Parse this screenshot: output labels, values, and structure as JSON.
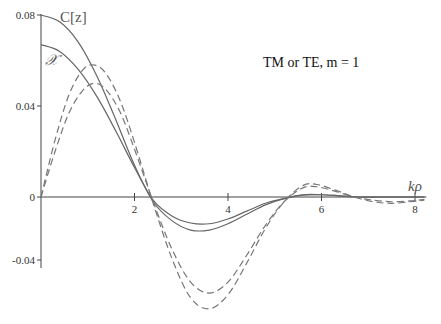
{
  "chart_data": {
    "type": "line",
    "title": "",
    "annotation": "TM or TE, m = 1",
    "xlabel": "kρ",
    "ylabel": "",
    "xlim": [
      0,
      8.2
    ],
    "ylim": [
      -0.04,
      0.08
    ],
    "grid": false,
    "x_ticks": [
      2,
      4,
      6,
      8
    ],
    "x_tick_labels": [
      "2",
      "4",
      "6",
      "8"
    ],
    "y_ticks": [
      0.08,
      0.04,
      0,
      -0.04
    ],
    "y_tick_labels": [
      "0.08",
      "0.04",
      "0",
      "-0.04"
    ],
    "series": [
      {
        "name": "C[z]",
        "style": "solid",
        "label": "C[z]",
        "x": [
          0,
          0.4,
          0.8,
          1.2,
          1.6,
          2.0,
          2.4,
          2.8,
          3.2,
          3.6,
          4.0,
          4.4,
          4.8,
          5.2,
          5.6,
          6.0,
          6.4,
          6.8,
          7.2,
          7.6,
          8.0,
          8.2
        ],
        "y": [
          0.08,
          0.077,
          0.068,
          0.053,
          0.034,
          0.014,
          -0.003,
          -0.015,
          -0.021,
          -0.021,
          -0.017,
          -0.011,
          -0.005,
          -0.001,
          0.001,
          0.001,
          0.0005,
          0.0,
          0.0,
          0.0,
          0.0,
          0.0
        ]
      },
      {
        "name": "X",
        "style": "solid",
        "label": "𝒳",
        "x": [
          0,
          0.4,
          0.8,
          1.2,
          1.6,
          2.0,
          2.4,
          2.8,
          3.2,
          3.6,
          4.0,
          4.4,
          4.8,
          5.2,
          5.6,
          6.0,
          6.4,
          6.8,
          7.2,
          7.6,
          8.0,
          8.2
        ],
        "y": [
          0.067,
          0.064,
          0.056,
          0.044,
          0.029,
          0.013,
          -0.002,
          -0.012,
          -0.0165,
          -0.017,
          -0.014,
          -0.009,
          -0.004,
          -0.001,
          0.0008,
          0.001,
          0.0005,
          0.0,
          0.0,
          0.0,
          0.0,
          0.0
        ]
      },
      {
        "name": "dashed-outer",
        "style": "dashed",
        "x": [
          0,
          0.3,
          0.6,
          0.9,
          1.15,
          1.4,
          1.7,
          2.0,
          2.4,
          2.8,
          3.2,
          3.6,
          4.0,
          4.4,
          4.8,
          5.2,
          5.6,
          5.9,
          6.3,
          6.7,
          7.1,
          7.5,
          7.9,
          8.2
        ],
        "y": [
          0.0,
          0.025,
          0.045,
          0.056,
          0.058,
          0.054,
          0.042,
          0.024,
          -0.004,
          -0.039,
          -0.064,
          -0.071,
          -0.062,
          -0.042,
          -0.02,
          -0.003,
          0.005,
          0.0055,
          0.003,
          0.0,
          -0.003,
          -0.004,
          -0.003,
          -0.002
        ]
      },
      {
        "name": "dashed-inner",
        "style": "dashed",
        "x": [
          0,
          0.3,
          0.6,
          0.9,
          1.15,
          1.4,
          1.7,
          2.0,
          2.4,
          2.8,
          3.2,
          3.6,
          4.0,
          4.4,
          4.8,
          5.2,
          5.6,
          5.9,
          6.3,
          6.7,
          7.1,
          7.5,
          7.9,
          8.2
        ],
        "y": [
          0.0,
          0.02,
          0.037,
          0.047,
          0.05,
          0.047,
          0.037,
          0.021,
          -0.003,
          -0.033,
          -0.054,
          -0.061,
          -0.054,
          -0.037,
          -0.018,
          -0.003,
          0.004,
          0.0045,
          0.0025,
          0.0,
          -0.002,
          -0.003,
          -0.0025,
          -0.0015
        ]
      }
    ]
  }
}
